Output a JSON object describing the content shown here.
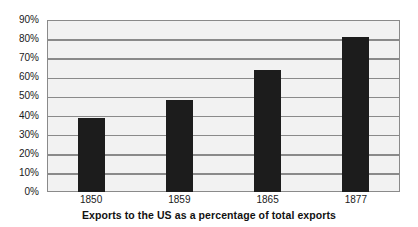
{
  "chart_data": {
    "type": "bar",
    "title": "",
    "caption": "Exports to the US as a percentage of total exports",
    "categories": [
      "1850",
      "1859",
      "1865",
      "1877"
    ],
    "values": [
      38.5,
      48,
      64,
      81
    ],
    "xlabel": "",
    "ylabel": "",
    "ylim": [
      0,
      90
    ],
    "ytick_labels": [
      "0%",
      "10%",
      "20%",
      "30%",
      "40%",
      "50%",
      "60%",
      "70%",
      "80%",
      "90%"
    ],
    "ytick_values": [
      0,
      10,
      20,
      30,
      40,
      50,
      60,
      70,
      80,
      90
    ],
    "grid": true,
    "legend": null,
    "colors": {
      "bar": "#1c1c1c",
      "plot_background": "#f2f2f2",
      "gridline": "#8a8a8a",
      "axis": "#8a8a8a",
      "text": "#1a1a1a",
      "caption": "#111111",
      "page_background": "#ffffff"
    }
  }
}
